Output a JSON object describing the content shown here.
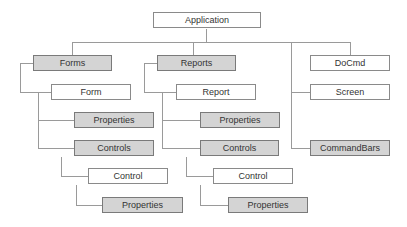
{
  "diagram": {
    "colors": {
      "gray_fill": "#d4d4d4",
      "white_fill": "#ffffff",
      "line": "#9a9a9a"
    },
    "root": "Application",
    "forms_branch": {
      "collection": "Forms",
      "object": "Form",
      "properties": "Properties",
      "controls": "Controls",
      "control": "Control",
      "control_properties": "Properties"
    },
    "reports_branch": {
      "collection": "Reports",
      "object": "Report",
      "properties": "Properties",
      "controls": "Controls",
      "control": "Control",
      "control_properties": "Properties"
    },
    "other_objects": [
      "DoCmd",
      "Screen",
      "CommandBars"
    ]
  }
}
